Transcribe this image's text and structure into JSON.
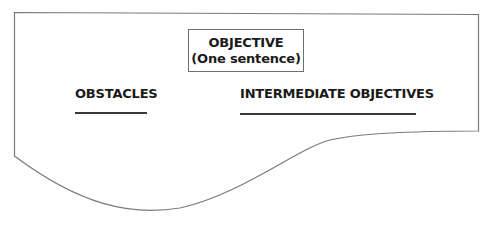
{
  "diagram": {
    "objective": {
      "title": "OBJECTIVE",
      "subtitle": "(One sentence)"
    },
    "columns": [
      {
        "heading": "OBSTACLES"
      },
      {
        "heading": "INTERMEDIATE OBJECTIVES"
      }
    ],
    "colors": {
      "frame_stroke": "#7a7a7a",
      "text": "#1a1a1a",
      "underline": "#3a3a3a"
    }
  }
}
